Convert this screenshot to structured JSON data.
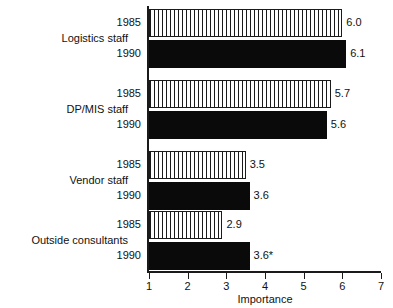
{
  "chart_data": {
    "type": "bar",
    "orientation": "horizontal",
    "title": "",
    "xlabel": "Importance",
    "ylabel": "",
    "xlim": [
      1,
      7
    ],
    "xticks": [
      1,
      2,
      3,
      4,
      5,
      6,
      7
    ],
    "grid": false,
    "legend": "none",
    "categories": [
      "Logistics staff",
      "DP/MIS staff",
      "Vendor staff",
      "Outside consultants"
    ],
    "series": [
      {
        "name": "1985",
        "style": "hatched-vertical-white",
        "values": [
          6.0,
          5.7,
          3.5,
          2.9
        ],
        "labels": [
          "6.0",
          "5.7",
          "3.5",
          "2.9"
        ]
      },
      {
        "name": "1990",
        "style": "solid-black",
        "values": [
          6.1,
          5.6,
          3.6,
          3.6
        ],
        "labels": [
          "6.1",
          "5.6",
          "3.6",
          "3.6*"
        ]
      }
    ],
    "footnote_marker": "*",
    "groups": [
      {
        "category": "Logistics staff",
        "bars": [
          {
            "year": "1985",
            "value": 6.0,
            "label": "6.0",
            "style": "hatched"
          },
          {
            "year": "1990",
            "value": 6.1,
            "label": "6.1",
            "style": "solid"
          }
        ]
      },
      {
        "category": "DP/MIS staff",
        "bars": [
          {
            "year": "1985",
            "value": 5.7,
            "label": "5.7",
            "style": "hatched"
          },
          {
            "year": "1990",
            "value": 5.6,
            "label": "5.6",
            "style": "solid"
          }
        ]
      },
      {
        "category": "Vendor staff",
        "bars": [
          {
            "year": "1985",
            "value": 3.5,
            "label": "3.5",
            "style": "hatched"
          },
          {
            "year": "1990",
            "value": 3.6,
            "label": "3.6",
            "style": "solid"
          }
        ]
      },
      {
        "category": "Outside consultants",
        "bars": [
          {
            "year": "1985",
            "value": 2.9,
            "label": "2.9",
            "style": "hatched"
          },
          {
            "year": "1990",
            "value": 3.6,
            "label": "3.6*",
            "style": "solid"
          }
        ]
      }
    ],
    "colors": {
      "axis": "#1a1a1a",
      "bar_1985_fill": "#ffffff",
      "bar_1985_hatch": "#1a1a1a",
      "bar_1990_fill": "#0a0a0a",
      "text": "#111111",
      "background": "#ffffff"
    }
  }
}
